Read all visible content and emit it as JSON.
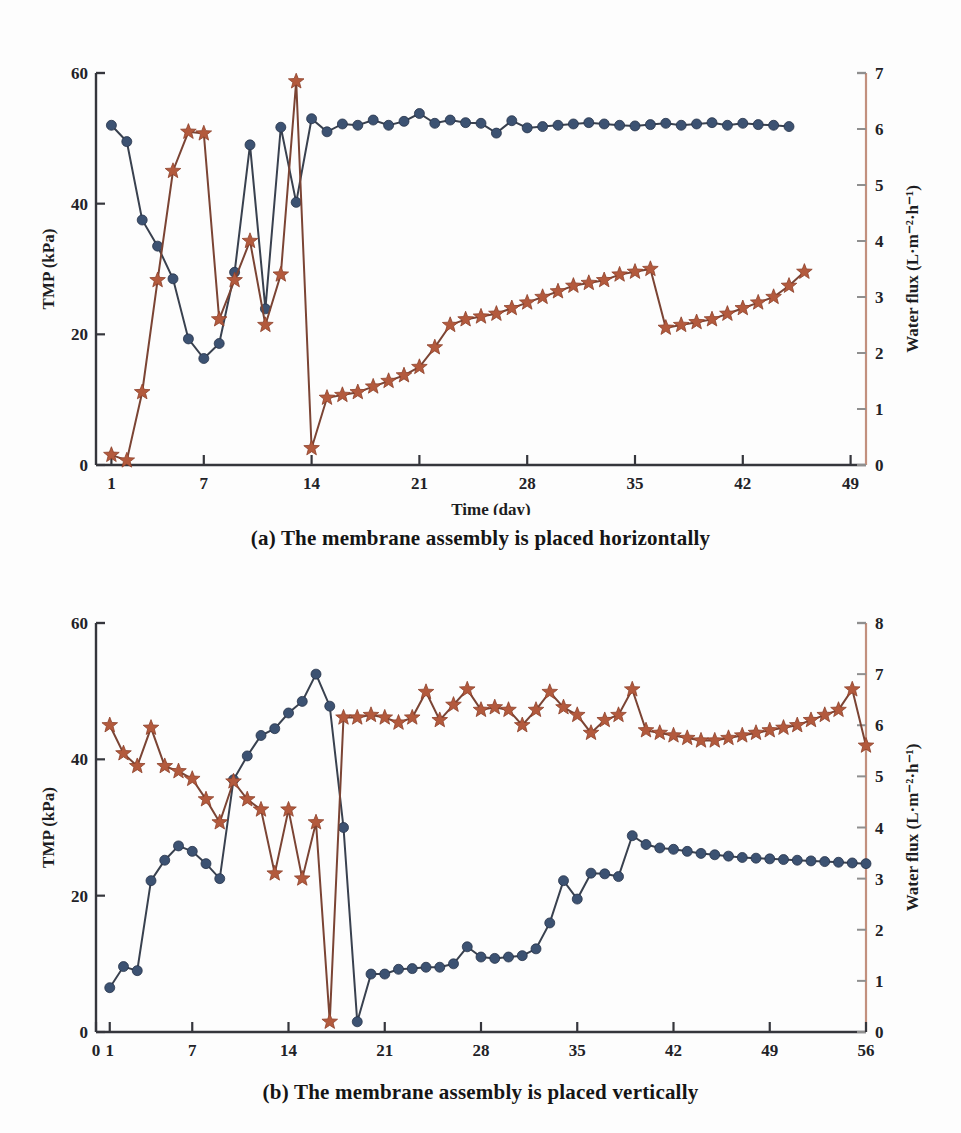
{
  "figure": {
    "panels": [
      {
        "id": "a",
        "caption": "(a) The membrane assembly is placed horizontally"
      },
      {
        "id": "b",
        "caption": "(b) The membrane assembly is placed vertically"
      }
    ]
  },
  "chart_data": [
    {
      "type": "line",
      "panel": "a",
      "title": "(a) The membrane assembly is placed horizontally",
      "xlabel": "Time (day)",
      "ylabel": "TMP (kPa)",
      "y2label": "Water flux (L·m⁻²·h⁻¹)",
      "xlim": [
        0,
        50
      ],
      "ylim": [
        0,
        60
      ],
      "y2lim": [
        0,
        7
      ],
      "xticks": [
        1,
        7,
        14,
        21,
        28,
        35,
        42,
        49
      ],
      "xtick_labels": [
        "1",
        "7",
        "14",
        "21",
        "28",
        "35",
        "42",
        "49"
      ],
      "yticks": [
        0,
        20,
        40,
        60
      ],
      "ytick_labels": [
        "0",
        "20",
        "40",
        "60"
      ],
      "y2ticks": [
        0,
        1,
        2,
        3,
        4,
        5,
        6,
        7
      ],
      "y2tick_labels": [
        "0",
        "1",
        "2",
        "3",
        "4",
        "5",
        "6",
        "7"
      ],
      "grid": false,
      "legend": "none",
      "series": [
        {
          "name": "TMP (kPa)",
          "axis": "left",
          "marker": "circle",
          "color": "#3c5272",
          "x": [
            1,
            2,
            3,
            4,
            5,
            6,
            7,
            8,
            9,
            10,
            11,
            12,
            13,
            14,
            15,
            16,
            17,
            18,
            19,
            20,
            21,
            22,
            23,
            24,
            25,
            26,
            27,
            28,
            29,
            30,
            31,
            32,
            33,
            34,
            35,
            36,
            37,
            38,
            39,
            40,
            41,
            42,
            43,
            44,
            45
          ],
          "y": [
            52.0,
            49.5,
            37.5,
            33.5,
            28.5,
            19.3,
            16.3,
            18.6,
            29.5,
            49.0,
            23.9,
            51.7,
            40.2,
            53.0,
            51.0,
            52.2,
            52.0,
            52.8,
            52.0,
            52.6,
            53.8,
            52.3,
            52.8,
            52.4,
            52.3,
            50.8,
            52.7,
            51.6,
            51.8,
            52.0,
            52.2,
            52.4,
            52.2,
            52.0,
            51.9,
            52.1,
            52.3,
            52.0,
            52.2,
            52.4,
            52.0,
            52.3,
            52.1,
            52.0,
            51.8
          ]
        },
        {
          "name": "Water flux (L·m⁻²·h⁻¹)",
          "axis": "right",
          "marker": "star",
          "color": "#b35a3d",
          "x": [
            1,
            2,
            3,
            4,
            5,
            6,
            7,
            8,
            9,
            10,
            11,
            12,
            13,
            14,
            15,
            16,
            17,
            18,
            19,
            20,
            21,
            22,
            23,
            24,
            25,
            26,
            27,
            28,
            29,
            30,
            31,
            32,
            33,
            34,
            35,
            36,
            37,
            38,
            39,
            40,
            41,
            42,
            43,
            44,
            45,
            46
          ],
          "y": [
            0.18,
            0.08,
            1.3,
            3.3,
            5.25,
            5.95,
            5.92,
            2.6,
            3.3,
            4.0,
            2.5,
            3.4,
            6.85,
            0.3,
            1.2,
            1.25,
            1.3,
            1.4,
            1.5,
            1.6,
            1.75,
            2.1,
            2.5,
            2.6,
            2.65,
            2.7,
            2.8,
            2.9,
            3.0,
            3.1,
            3.2,
            3.25,
            3.3,
            3.4,
            3.45,
            3.5,
            2.45,
            2.5,
            2.55,
            2.6,
            2.7,
            2.8,
            2.9,
            3.0,
            3.2,
            3.45
          ]
        }
      ]
    },
    {
      "type": "line",
      "panel": "b",
      "title": "(b) The membrane assembly is placed vertically",
      "xlabel": "Time (day)",
      "ylabel": "TMP (kPa)",
      "y2label": "Water flux (L·m⁻²·h⁻¹)",
      "xlim": [
        0,
        56
      ],
      "ylim": [
        0,
        60
      ],
      "y2lim": [
        0,
        8
      ],
      "xticks": [
        0,
        1,
        7,
        14,
        21,
        28,
        35,
        42,
        49,
        56
      ],
      "xtick_labels": [
        "0",
        "1",
        "7",
        "14",
        "21",
        "28",
        "35",
        "42",
        "49",
        "56"
      ],
      "yticks": [
        0,
        20,
        40,
        60
      ],
      "ytick_labels": [
        "0",
        "20",
        "40",
        "60"
      ],
      "y2ticks": [
        0,
        1,
        2,
        3,
        4,
        5,
        6,
        7,
        8
      ],
      "y2tick_labels": [
        "0",
        "1",
        "2",
        "3",
        "4",
        "5",
        "6",
        "7",
        "8"
      ],
      "grid": false,
      "legend": "none",
      "series": [
        {
          "name": "TMP (kPa)",
          "axis": "left",
          "marker": "circle",
          "color": "#3c5272",
          "x": [
            1,
            2,
            3,
            4,
            5,
            6,
            7,
            8,
            9,
            10,
            11,
            12,
            13,
            14,
            15,
            16,
            17,
            18,
            19,
            20,
            21,
            22,
            23,
            24,
            25,
            26,
            27,
            28,
            29,
            30,
            31,
            32,
            33,
            34,
            35,
            36,
            37,
            38,
            39,
            40,
            41,
            42,
            43,
            44,
            45,
            46,
            47,
            48,
            49,
            50,
            51,
            52,
            53,
            54,
            55,
            56
          ],
          "y": [
            6.5,
            9.6,
            9.0,
            22.2,
            25.2,
            27.3,
            26.5,
            24.7,
            22.5,
            37.0,
            40.5,
            43.5,
            44.5,
            46.8,
            48.5,
            52.5,
            47.8,
            30.0,
            1.5,
            8.5,
            8.5,
            9.2,
            9.3,
            9.5,
            9.5,
            10.0,
            12.5,
            11.0,
            10.8,
            11.0,
            11.2,
            12.2,
            16.0,
            22.2,
            19.5,
            23.3,
            23.2,
            22.8,
            28.8,
            27.5,
            27.0,
            26.8,
            26.5,
            26.2,
            26.0,
            25.8,
            25.6,
            25.5,
            25.4,
            25.3,
            25.2,
            25.1,
            25.0,
            24.9,
            24.8,
            24.7
          ]
        },
        {
          "name": "Water flux (L·m⁻²·h⁻¹)",
          "axis": "right",
          "marker": "star",
          "color": "#b35a3d",
          "x": [
            1,
            2,
            3,
            4,
            5,
            6,
            7,
            8,
            9,
            10,
            11,
            12,
            13,
            14,
            15,
            16,
            17,
            18,
            19,
            20,
            21,
            22,
            23,
            24,
            25,
            26,
            27,
            28,
            29,
            30,
            31,
            32,
            33,
            34,
            35,
            36,
            37,
            38,
            39,
            40,
            41,
            42,
            43,
            44,
            45,
            46,
            47,
            48,
            49,
            50,
            51,
            52,
            53,
            54,
            55,
            56
          ],
          "y": [
            6.0,
            5.45,
            5.2,
            5.95,
            5.2,
            5.1,
            4.95,
            4.55,
            4.1,
            4.9,
            4.55,
            4.35,
            3.1,
            4.35,
            3.0,
            4.1,
            0.2,
            6.15,
            6.15,
            6.2,
            6.15,
            6.05,
            6.15,
            6.65,
            6.1,
            6.4,
            6.7,
            6.3,
            6.35,
            6.3,
            6.0,
            6.3,
            6.65,
            6.35,
            6.2,
            5.85,
            6.1,
            6.2,
            6.7,
            5.9,
            5.85,
            5.8,
            5.75,
            5.7,
            5.7,
            5.75,
            5.8,
            5.85,
            5.9,
            5.95,
            6.0,
            6.1,
            6.2,
            6.3,
            6.7,
            5.6
          ]
        }
      ]
    }
  ]
}
